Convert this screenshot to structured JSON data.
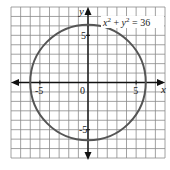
{
  "chart_data": {
    "type": "line",
    "title": "",
    "annotation": {
      "x_part": "x",
      "x_exp": "2",
      "plus": " + ",
      "y_part": "y",
      "y_exp": "2",
      "rhs": " = 36"
    },
    "xlabel": "x",
    "ylabel": "y",
    "xlim": [
      -8,
      8
    ],
    "ylim": [
      -8,
      8
    ],
    "grid": true,
    "grid_step": 1,
    "origin_label": "0",
    "x_ticks": [
      {
        "value": -5,
        "label": "-5"
      },
      {
        "value": 5,
        "label": "5"
      }
    ],
    "y_ticks": [
      {
        "value": 5,
        "label": "5"
      },
      {
        "value": -5,
        "label": "-5"
      }
    ],
    "series": [
      {
        "name": "circle",
        "equation": "x^2 + y^2 = 36",
        "center": [
          0,
          0
        ],
        "radius": 6,
        "color": "#555555"
      }
    ]
  }
}
